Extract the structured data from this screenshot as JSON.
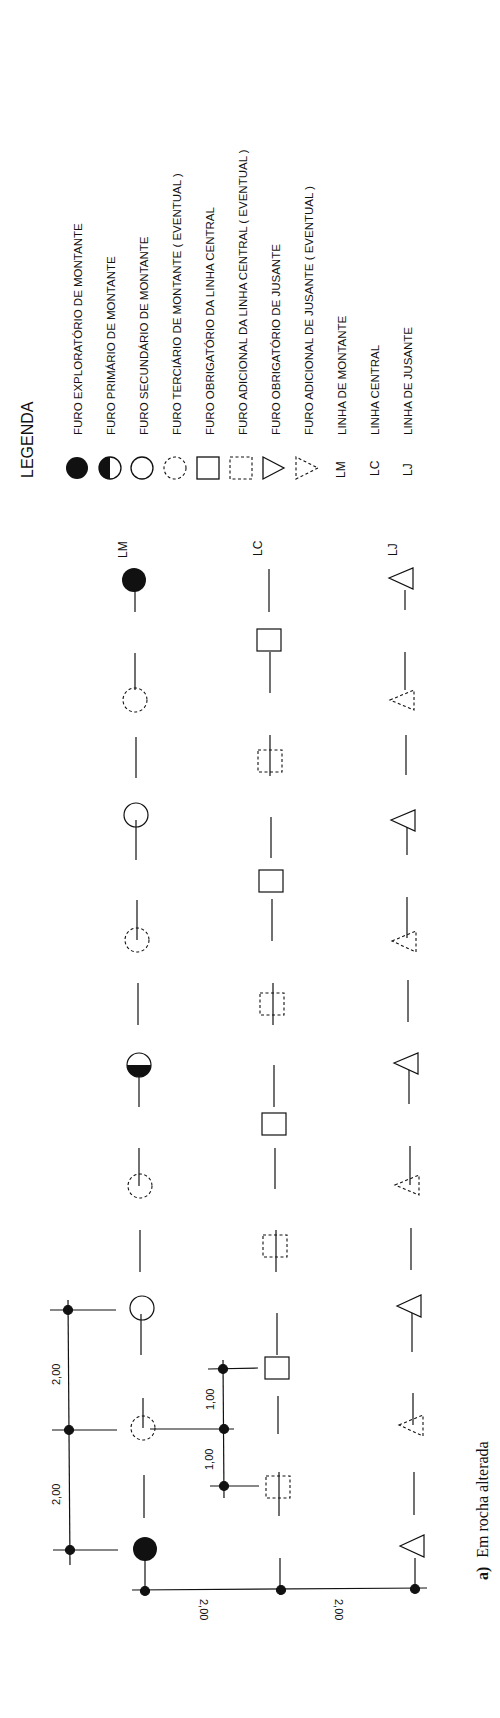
{
  "legend": {
    "title": "LEGENDA",
    "items": [
      {
        "symbol": "filled-circle",
        "label": "FURO EXPLORATÓRIO DE MONTANTE"
      },
      {
        "symbol": "half-filled-circle",
        "label": "FURO PRIMÁRIO DE MONTANTE"
      },
      {
        "symbol": "open-circle",
        "label": "FURO SECUNDÁRIO DE MONTANTE"
      },
      {
        "symbol": "dashed-circle",
        "label": "FURO TERCIÁRIO DE MONTANTE ( EVENTUAL )"
      },
      {
        "symbol": "open-square",
        "label": "FURO OBRIGATÓRIO DA LINHA CENTRAL"
      },
      {
        "symbol": "dashed-square",
        "label": "FURO ADICIONAL DA LINHA CENTRAL ( EVENTUAL )"
      },
      {
        "symbol": "open-triangle",
        "label": "FURO OBRIGATÓRIO DE JUSANTE"
      },
      {
        "symbol": "dashed-triangle",
        "label": "FURO ADICIONAL DE JUSANTE ( EVENTUAL )"
      },
      {
        "symbol": "LM",
        "label": "LINHA DE MONTANTE"
      },
      {
        "symbol": "LC",
        "label": "LINHA CENTRAL"
      },
      {
        "symbol": "LJ",
        "label": "LINHA DE JUSANTE"
      }
    ]
  },
  "lines": {
    "lm": {
      "tag": "LM",
      "symbols": [
        "filled-circle",
        "dashed-circle",
        "open-circle",
        "dashed-circle",
        "half-filled-circle",
        "dashed-circle",
        "open-circle",
        "dashed-circle",
        "filled-circle"
      ]
    },
    "lc": {
      "tag": "LC",
      "symbols": [
        "open-square",
        "dashed-square",
        "open-square",
        "dashed-square",
        "open-square",
        "dashed-square",
        "open-square",
        "dashed-square"
      ]
    },
    "lj": {
      "tag": "LJ",
      "symbols": [
        "open-triangle",
        "dashed-triangle",
        "open-triangle",
        "dashed-triangle",
        "open-triangle",
        "dashed-triangle",
        "open-triangle",
        "dashed-triangle",
        "open-triangle"
      ]
    }
  },
  "dimensions": {
    "lm_spacing_1": "2,00",
    "lm_spacing_2": "2,00",
    "lc_spacing_1": "1,00",
    "lc_spacing_2": "1,00",
    "line_offset_1": "2,00",
    "line_offset_2": "2,00"
  },
  "caption": {
    "prefix": "a)",
    "text": "Em rocha alterada"
  }
}
